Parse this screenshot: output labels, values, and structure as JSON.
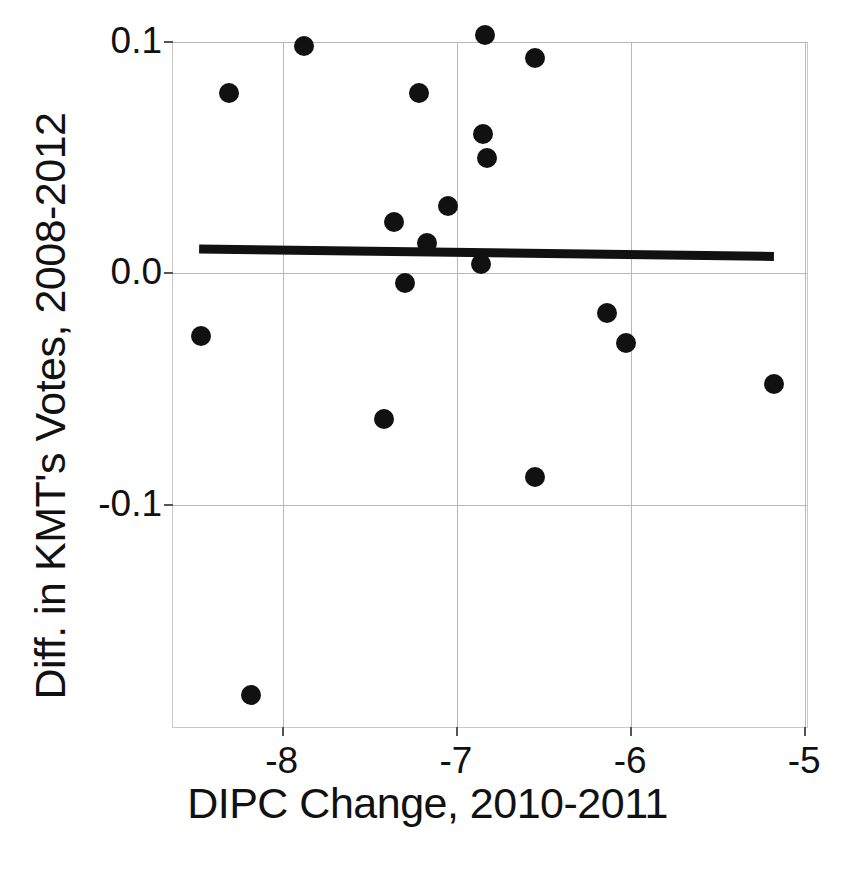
{
  "chart_data": {
    "type": "scatter",
    "title": "",
    "xlabel": "DIPC Change, 2010-2011",
    "ylabel": "Diff. in KMT's Votes, 2008-2012",
    "xlim": [
      -8.63,
      -4.99
    ],
    "ylim": [
      -0.196,
      0.0995
    ],
    "grid": true,
    "legend": "none",
    "xticks": [
      -8,
      -7,
      -6,
      -5
    ],
    "xticklabels": [
      "-8",
      "-7",
      "-6",
      "-5"
    ],
    "yticks": [
      0.1,
      0.0,
      -0.1
    ],
    "yticklabels": [
      "0.1",
      "0.0",
      "-0.1"
    ],
    "series": [
      {
        "name": "townships",
        "marker": "filled-circle",
        "color": "#111111",
        "points": [
          {
            "x": -8.47,
            "y": -0.027
          },
          {
            "x": -8.31,
            "y": 0.078
          },
          {
            "x": -8.18,
            "y": -0.182
          },
          {
            "x": -7.88,
            "y": 0.098
          },
          {
            "x": -7.42,
            "y": -0.063
          },
          {
            "x": -7.36,
            "y": 0.022
          },
          {
            "x": -7.3,
            "y": -0.004
          },
          {
            "x": -7.22,
            "y": 0.078
          },
          {
            "x": -7.17,
            "y": 0.013
          },
          {
            "x": -7.05,
            "y": 0.029
          },
          {
            "x": -6.86,
            "y": 0.004
          },
          {
            "x": -6.85,
            "y": 0.06
          },
          {
            "x": -6.84,
            "y": 0.103
          },
          {
            "x": -6.83,
            "y": 0.05
          },
          {
            "x": -6.55,
            "y": 0.093
          },
          {
            "x": -6.55,
            "y": -0.088
          },
          {
            "x": -6.14,
            "y": -0.017
          },
          {
            "x": -6.03,
            "y": -0.03
          },
          {
            "x": -5.18,
            "y": -0.048
          }
        ]
      }
    ],
    "trendline": {
      "name": "fitted regression line",
      "color": "#111111",
      "width_px": 9,
      "x_start": -8.48,
      "y_start": 0.0105,
      "x_end": -5.18,
      "y_end": 0.0073
    }
  }
}
